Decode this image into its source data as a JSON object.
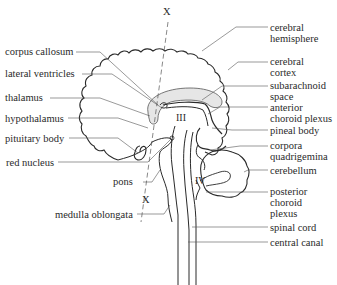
{
  "diagram": {
    "section_markers": {
      "top": "X",
      "bottom": "X"
    },
    "ventricle_labels": {
      "third": "III",
      "fourth": "IV"
    },
    "labels_left": [
      {
        "text": "corpus callosum"
      },
      {
        "text": "lateral ventricles"
      },
      {
        "text": "thalamus"
      },
      {
        "text": "hypothalamus"
      },
      {
        "text": "pituitary body"
      },
      {
        "text": "red nucleus"
      },
      {
        "text": "pons"
      },
      {
        "text": "medulla oblongata"
      }
    ],
    "labels_right": [
      {
        "text": "cerebral\nhemisphere"
      },
      {
        "text": "cerebral\ncortex"
      },
      {
        "text": "subarachnoid\nspace"
      },
      {
        "text": "anterior\nchoroid plexus"
      },
      {
        "text": "pineal body"
      },
      {
        "text": "corpora\nquadrigemina"
      },
      {
        "text": "cerebellum"
      },
      {
        "text": "posterior\nchoroid\nplexus"
      },
      {
        "text": "spinal cord"
      },
      {
        "text": "central canal"
      }
    ],
    "colors": {
      "line": "#2a2a2a",
      "leader": "#555555",
      "shade": "#e6e6e6"
    }
  }
}
